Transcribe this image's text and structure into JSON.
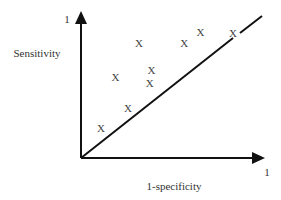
{
  "chart_data": {
    "type": "scatter",
    "title": "",
    "xlabel": "1-specificity",
    "ylabel": "Sensitivity",
    "x_axis_end_label": "1",
    "y_axis_end_label": "1",
    "xlim": [
      0,
      1
    ],
    "ylim": [
      0,
      1
    ],
    "grid": false,
    "legend": null,
    "marker": "X",
    "reference_line": {
      "from": [
        0,
        0
      ],
      "to": [
        1,
        1
      ],
      "label": "chance diagonal"
    },
    "points": [
      {
        "x": 0.11,
        "y": 0.21
      },
      {
        "x": 0.26,
        "y": 0.35
      },
      {
        "x": 0.19,
        "y": 0.57
      },
      {
        "x": 0.38,
        "y": 0.53
      },
      {
        "x": 0.39,
        "y": 0.62
      },
      {
        "x": 0.32,
        "y": 0.81
      },
      {
        "x": 0.57,
        "y": 0.81
      },
      {
        "x": 0.66,
        "y": 0.89
      },
      {
        "x": 0.84,
        "y": 0.88
      }
    ]
  },
  "labels": {
    "ylabel": "Sensitivity",
    "xlabel": "1-specificity",
    "x_end": "1",
    "y_end": "1",
    "marker": "X"
  },
  "colors": {
    "axis": "#111111",
    "text": "#333333",
    "marker": "#444444"
  }
}
